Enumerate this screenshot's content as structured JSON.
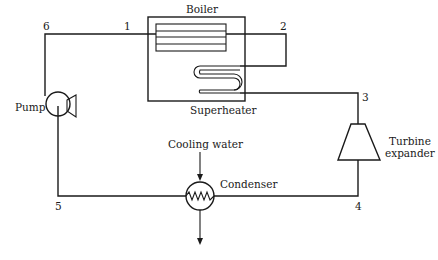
{
  "diagram": {
    "type": "Rankine cycle schematic",
    "components": {
      "boiler": {
        "label": "Boiler"
      },
      "superheater": {
        "label": "Superheater"
      },
      "turbine": {
        "label_line1": "Turbine",
        "label_line2": "expander"
      },
      "condenser": {
        "label": "Condenser"
      },
      "cooling_water": {
        "label": "Cooling water"
      },
      "pump": {
        "label": "Pump"
      }
    },
    "state_points": {
      "p1": "1",
      "p2": "2",
      "p3": "3",
      "p4": "4",
      "p5": "5",
      "p6": "6"
    },
    "flow_sequence": [
      "6",
      "1",
      "2",
      "3",
      "4",
      "5",
      "6"
    ],
    "colors": {
      "stroke": "#1a1a1a",
      "background": "#ffffff"
    }
  }
}
